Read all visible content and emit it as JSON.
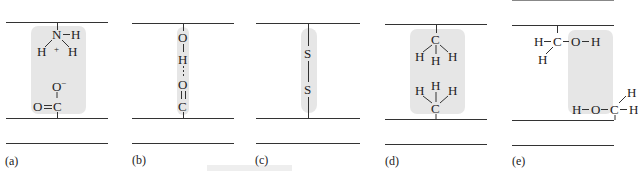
{
  "figure": {
    "panels": [
      {
        "label": "(a)",
        "interaction": "salt bridge (ionic bond)",
        "top_group": {
          "center": "N",
          "charge": "+",
          "substituents": [
            "H",
            "H",
            "H"
          ]
        },
        "bottom_group": {
          "center": "C",
          "atoms": [
            "O",
            "O"
          ],
          "charge": "−",
          "double_bond": "O=C"
        }
      },
      {
        "label": "(b)",
        "interaction": "hydrogen bond",
        "atoms": [
          "O",
          "H",
          "O",
          "C"
        ]
      },
      {
        "label": "(c)",
        "interaction": "disulfide bond",
        "atoms": [
          "S",
          "S"
        ]
      },
      {
        "label": "(d)",
        "interaction": "hydrophobic interaction",
        "top_group": {
          "center": "C",
          "substituents": [
            "H",
            "H",
            "H"
          ]
        },
        "bottom_group": {
          "center": "C",
          "substituents": [
            "H",
            "H",
            "H"
          ]
        }
      },
      {
        "label": "(e)",
        "interaction": "hydrogen bond between hydroxyl groups",
        "top_group": {
          "center": "C",
          "text": [
            "H",
            "C",
            "O",
            "H"
          ],
          "extra_H": "H"
        },
        "bottom_group": {
          "center": "C",
          "text": [
            "H",
            "O",
            "C",
            "H"
          ],
          "extra_H": "H"
        }
      }
    ]
  }
}
